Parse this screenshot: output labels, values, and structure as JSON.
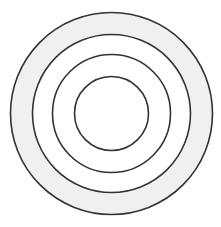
{
  "diagram": {
    "type": "concentric-circles",
    "center": {
      "x": 111.5,
      "y": 113.5
    },
    "stroke_color": "#333333",
    "stroke_width": 1.6,
    "rings": [
      {
        "name": "outer-ring",
        "r": 101,
        "fill": "#f0f0f0"
      },
      {
        "name": "second-ring",
        "r": 79,
        "fill": "#ffffff"
      },
      {
        "name": "third-ring",
        "r": 59,
        "fill": "#ffffff"
      },
      {
        "name": "inner-circle",
        "r": 37,
        "fill": "#ffffff"
      }
    ]
  }
}
